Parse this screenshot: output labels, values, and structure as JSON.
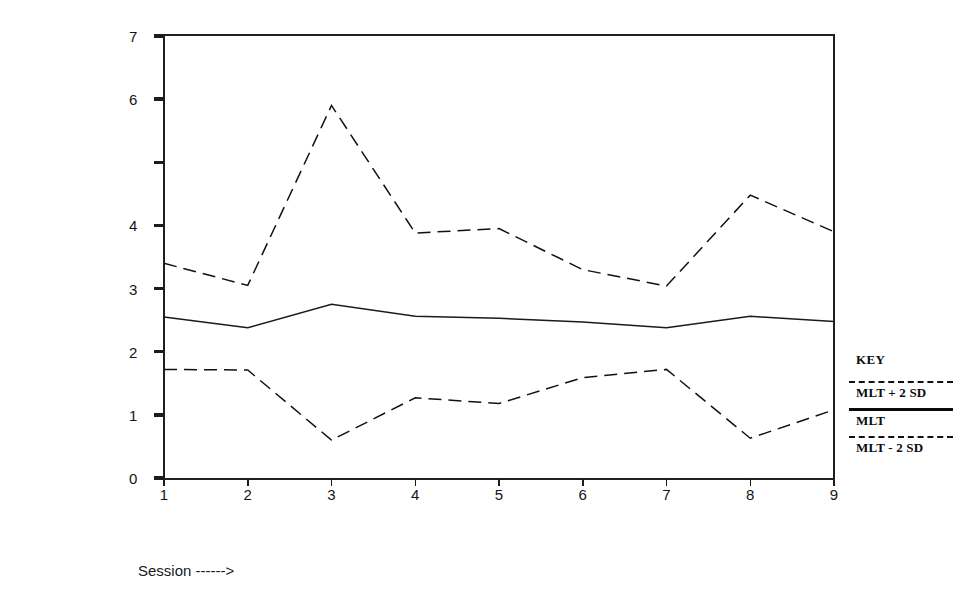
{
  "chart_data": {
    "type": "line",
    "title": "",
    "xlabel": "Session ------>",
    "ylabel": "Number of acts per turn",
    "x": [
      1,
      2,
      3,
      4,
      5,
      6,
      7,
      8,
      9
    ],
    "xlim": [
      1,
      9
    ],
    "ylim": [
      0,
      7
    ],
    "xticks": [
      "1",
      "2",
      "3",
      "4",
      "5",
      "6",
      "7",
      "8",
      "9"
    ],
    "yticks": [
      {
        "value": 0,
        "label": "0"
      },
      {
        "value": 1,
        "label": "1"
      },
      {
        "value": 2,
        "label": "2"
      },
      {
        "value": 3,
        "label": "3"
      },
      {
        "value": 4,
        "label": "4"
      },
      {
        "value": 5,
        "label": ""
      },
      {
        "value": 6,
        "label": "6"
      },
      {
        "value": 7,
        "label": "7"
      }
    ],
    "grid": false,
    "legend_position": "right",
    "series": [
      {
        "name": "MLT + 2 SD",
        "style": "dashed",
        "color": "#111111",
        "values": [
          3.4,
          3.05,
          5.9,
          3.88,
          3.95,
          3.3,
          3.04,
          4.48,
          3.9
        ]
      },
      {
        "name": "MLT",
        "style": "solid",
        "color": "#1a1a1a",
        "values": [
          2.55,
          2.38,
          2.75,
          2.56,
          2.53,
          2.47,
          2.38,
          2.56,
          2.48
        ]
      },
      {
        "name": "MLT - 2 SD",
        "style": "dashed",
        "color": "#111111",
        "values": [
          1.72,
          1.71,
          0.6,
          1.27,
          1.18,
          1.59,
          1.72,
          0.63,
          1.08
        ]
      }
    ]
  },
  "legend": {
    "title": "KEY",
    "entries": [
      {
        "label": "MLT + 2 SD",
        "style": "dashed"
      },
      {
        "label": "MLT",
        "style": "solid"
      },
      {
        "label": "MLT - 2 SD",
        "style": "dashed"
      }
    ]
  },
  "axes": {
    "y_title": "Number of acts per turn",
    "x_caption": "Session ------>"
  }
}
